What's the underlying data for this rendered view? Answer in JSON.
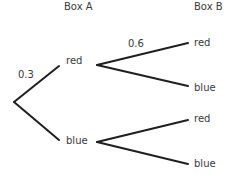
{
  "headers": {
    "box_a": "Box A",
    "box_b": "Box B"
  },
  "first_level": {
    "upper_outcome": "red",
    "lower_outcome": "blue",
    "upper_probability": "0.3"
  },
  "second_level": {
    "from_red": {
      "upper_outcome": "red",
      "lower_outcome": "blue",
      "upper_probability": "0.6"
    },
    "from_blue": {
      "upper_outcome": "red",
      "lower_outcome": "blue"
    }
  },
  "colors": {
    "line": "#1f1f1f",
    "text": "#3a3a3a",
    "background": "#ffffff"
  }
}
